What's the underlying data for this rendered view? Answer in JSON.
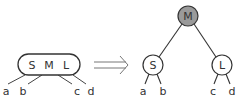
{
  "left_node": {
    "keys": [
      "S",
      "M",
      "L"
    ],
    "children": [
      "a",
      "b",
      "c",
      "d"
    ]
  },
  "arrow": {
    "type": "double-arrow",
    "direction": "right"
  },
  "right_tree": {
    "root": {
      "label": "M",
      "fill": "#9a9a9a"
    },
    "left_child": {
      "label": "S",
      "children": [
        "a",
        "b"
      ]
    },
    "right_child": {
      "label": "L",
      "children": [
        "c",
        "d"
      ]
    }
  },
  "colors": {
    "stroke": "#333333",
    "root_fill": "#9a9a9a",
    "node_fill": "#ffffff"
  }
}
